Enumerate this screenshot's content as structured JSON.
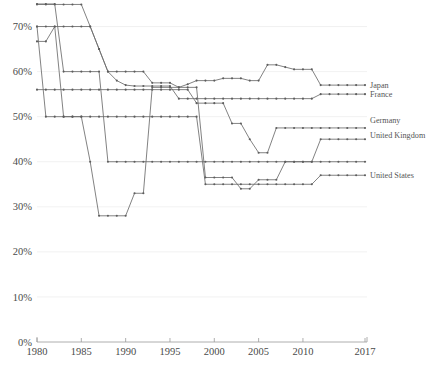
{
  "chart_data": {
    "type": "line",
    "title": "",
    "subtitle": "",
    "xlabel": "",
    "ylabel": "",
    "xlim": [
      1980,
      2017
    ],
    "ylim": [
      0,
      75
    ],
    "grid": true,
    "legend_position": "right-outside",
    "y_tick_labels": [
      "0%",
      "10%",
      "20%",
      "30%",
      "40%",
      "50%",
      "60%",
      "70%"
    ],
    "y_tick_values": [
      0,
      10,
      20,
      30,
      40,
      50,
      60,
      70
    ],
    "x_tick_labels": [
      "1980",
      "1985",
      "1990",
      "1995",
      "2000",
      "2005",
      "2010",
      "2017"
    ],
    "x_tick_values": [
      1980,
      1985,
      1990,
      1995,
      2000,
      2005,
      2010,
      2017
    ],
    "series": [
      {
        "name": "Japan",
        "label": "Japan",
        "x": [
          1980,
          1981,
          1982,
          1983,
          1984,
          1985,
          1986,
          1987,
          1988,
          1989,
          1990,
          1991,
          1992,
          1993,
          1994,
          1995,
          1996,
          1997,
          1998,
          1999,
          2000,
          2001,
          2002,
          2003,
          2004,
          2005,
          2006,
          2007,
          2008,
          2009,
          2010,
          2011,
          2012,
          2013,
          2014,
          2015,
          2016,
          2017
        ],
        "values": [
          74.9,
          74.9,
          74.9,
          74.9,
          74.9,
          74.9,
          70.0,
          65.0,
          60.0,
          60.0,
          60.0,
          60.0,
          60.0,
          57.5,
          57.5,
          57.5,
          56.5,
          57.2,
          58.0,
          58.0,
          58.0,
          58.5,
          58.5,
          58.5,
          58.0,
          58.0,
          61.5,
          61.5,
          61.0,
          60.5,
          60.5,
          60.5,
          57.0,
          57.0,
          57.0,
          57.0,
          57.0,
          57.0
        ]
      },
      {
        "name": "France",
        "label": "France",
        "x": [
          1980,
          1981,
          1982,
          1983,
          1984,
          1985,
          1986,
          1987,
          1988,
          1989,
          1990,
          1991,
          1992,
          1993,
          1994,
          1995,
          1996,
          1997,
          1998,
          1999,
          2000,
          2001,
          2002,
          2003,
          2004,
          2005,
          2006,
          2007,
          2008,
          2009,
          2010,
          2011,
          2012,
          2013,
          2014,
          2015,
          2016,
          2017
        ],
        "values": [
          66.7,
          66.7,
          70.0,
          70.0,
          70.0,
          70.0,
          70.0,
          65.0,
          60.0,
          58.0,
          57.0,
          56.8,
          56.8,
          56.8,
          56.8,
          56.8,
          54.0,
          54.0,
          54.0,
          54.0,
          54.0,
          54.0,
          54.0,
          54.0,
          54.0,
          54.0,
          54.0,
          54.0,
          54.0,
          54.0,
          54.0,
          54.0,
          55.0,
          55.0,
          55.0,
          55.0,
          55.0,
          55.0
        ]
      },
      {
        "name": "United Kingdom",
        "label": "United Kingdom",
        "x": [
          1980,
          1981,
          1982,
          1983,
          1984,
          1985,
          1986,
          1987,
          1988,
          1989,
          1990,
          1991,
          1992,
          1993,
          1994,
          1995,
          1996,
          1997,
          1998,
          1999,
          2000,
          2001,
          2002,
          2003,
          2004,
          2005,
          2006,
          2007,
          2008,
          2009,
          2010,
          2011,
          2012,
          2013,
          2014,
          2015,
          2016,
          2017
        ],
        "values": [
          75.0,
          75.0,
          75.0,
          60.0,
          60.0,
          60.0,
          60.0,
          60.0,
          40.0,
          40.0,
          40.0,
          40.0,
          40.0,
          40.0,
          40.0,
          40.0,
          40.0,
          40.0,
          40.0,
          40.0,
          40.0,
          40.0,
          40.0,
          40.0,
          40.0,
          40.0,
          40.0,
          40.0,
          40.0,
          40.0,
          40.0,
          40.0,
          45.0,
          45.0,
          45.0,
          45.0,
          45.0,
          45.0
        ]
      },
      {
        "name": "Germany",
        "label": "Germany",
        "x": [
          1980,
          1981,
          1982,
          1983,
          1984,
          1985,
          1986,
          1987,
          1988,
          1989,
          1990,
          1991,
          1992,
          1993,
          1994,
          1995,
          1996,
          1997,
          1998,
          1999,
          2000,
          2001,
          2002,
          2003,
          2004,
          2005,
          2006,
          2007,
          2008,
          2009,
          2010,
          2011,
          2012,
          2013,
          2014,
          2015,
          2016,
          2017
        ],
        "values": [
          56.0,
          56.0,
          56.0,
          56.0,
          56.0,
          56.0,
          56.0,
          56.0,
          56.0,
          56.0,
          56.0,
          56.0,
          56.0,
          56.0,
          56.0,
          56.0,
          56.0,
          56.0,
          53.0,
          53.0,
          53.0,
          53.0,
          48.5,
          48.5,
          45.0,
          42.0,
          42.0,
          47.5,
          47.5,
          47.5,
          47.5,
          47.5,
          47.5,
          47.5,
          47.5,
          47.5,
          47.5,
          47.5
        ]
      },
      {
        "name": "United States",
        "label": "United States",
        "x": [
          1980,
          1981,
          1982,
          1983,
          1984,
          1985,
          1986,
          1987,
          1988,
          1989,
          1990,
          1991,
          1992,
          1993,
          1994,
          1995,
          1996,
          1997,
          1998,
          1999,
          2000,
          2001,
          2002,
          2003,
          2004,
          2005,
          2006,
          2007,
          2008,
          2009,
          2010,
          2011,
          2012,
          2013,
          2014,
          2015,
          2016,
          2017
        ],
        "values": [
          70.0,
          50.0,
          50.0,
          50.0,
          50.0,
          50.0,
          50.0,
          50.0,
          50.0,
          50.0,
          50.0,
          50.0,
          50.0,
          50.0,
          50.0,
          50.0,
          50.0,
          50.0,
          50.0,
          35.0,
          35.0,
          35.0,
          35.0,
          35.0,
          35.0,
          35.0,
          35.0,
          35.0,
          35.0,
          35.0,
          35.0,
          35.0,
          37.0,
          37.0,
          37.0,
          37.0,
          37.0,
          37.0
        ]
      },
      {
        "name": "series-6",
        "label": "",
        "x": [
          1980,
          1981,
          1982,
          1983,
          1984,
          1985,
          1986,
          1987,
          1988,
          1989,
          1990,
          1991,
          1992,
          1993,
          1994,
          1995,
          1996,
          1997,
          1998,
          1999,
          2000,
          2001,
          2002,
          2003,
          2004,
          2005,
          2006,
          2007,
          2008,
          2009,
          2010,
          2011,
          2012,
          2013,
          2014,
          2015,
          2016,
          2017
        ],
        "values": [
          70.0,
          70.0,
          70.0,
          50.0,
          50.0,
          50.0,
          40.0,
          28.0,
          28.0,
          28.0,
          28.0,
          33.0,
          33.0,
          56.5,
          56.5,
          56.5,
          56.5,
          56.5,
          56.5,
          36.5,
          36.5,
          36.5,
          36.5,
          34.0,
          34.0,
          36.0,
          36.0,
          36.0,
          40.0,
          40.0,
          40.0,
          40.0,
          40.0,
          40.0,
          40.0,
          40.0,
          40.0,
          40.0
        ]
      }
    ],
    "annotations": []
  },
  "legend": {
    "entries": [
      {
        "label": "Japan"
      },
      {
        "label": "France"
      },
      {
        "label": "United Kingdom"
      },
      {
        "label": "Germany"
      },
      {
        "label": "United States"
      }
    ]
  },
  "caption": {
    "text": ""
  },
  "colors": {
    "line": "#6b6b6b",
    "axis": "#9a9a9a",
    "grid": "#e8e8e8",
    "text": "#4a4a4a",
    "background": "#ffffff"
  }
}
